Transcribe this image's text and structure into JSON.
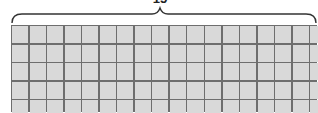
{
  "diagram": {
    "brace_label": "15",
    "grid": {
      "rows": 5,
      "columns": 19,
      "cell_fill": "#d9d9d9",
      "line_color": "#6e6e6e"
    }
  }
}
